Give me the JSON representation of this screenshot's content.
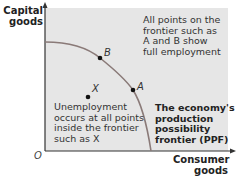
{
  "axes": {
    "y_label": "Capital goods",
    "x_label": "Consumer goods",
    "origin": "O"
  },
  "points": [
    {
      "name": "B",
      "x": 100,
      "y": 58
    },
    {
      "name": "A",
      "x": 133,
      "y": 90
    },
    {
      "name": "X",
      "x": 88,
      "y": 97
    }
  ],
  "annotations": {
    "frontier_note_lines": [
      "All points on the",
      "frontier such as",
      "A and B show",
      "full employment"
    ],
    "unemployment_note_lines": [
      "Unemployment",
      "occurs at all points",
      "inside the frontier",
      "such as X"
    ],
    "ppf_label_lines": [
      "The economy's",
      "production",
      "possibility",
      "frontier (PPF)"
    ]
  },
  "colors": {
    "plot_bg": "#e6e6e6",
    "curve": "#8a7a78",
    "axis": "#333333"
  }
}
